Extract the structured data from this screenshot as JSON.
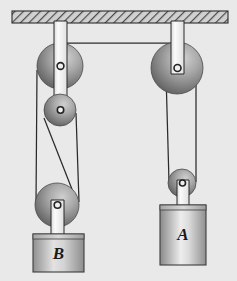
{
  "diagram": {
    "background_color": "#e9e9e9",
    "ceiling": {
      "label": "ceiling-support",
      "x": 12,
      "y": 11,
      "width": 216,
      "height": 12,
      "fill": "#c8c8c8",
      "stroke": "#2a2a2a",
      "hatch": "diagonal"
    },
    "rope_color": "#2b2b2b",
    "bracket_fill": "#f2f2f2",
    "bracket_stroke": "#2a2a2a",
    "pulleys": [
      {
        "name": "top-left-pulley",
        "cx": 60,
        "cy": 66,
        "r": 23,
        "label": ""
      },
      {
        "name": "middle-left-pulley",
        "cx": 60,
        "cy": 110,
        "r": 16,
        "label": ""
      },
      {
        "name": "bottom-left-pulley",
        "cx": 57,
        "cy": 205,
        "r": 22,
        "label": ""
      },
      {
        "name": "top-right-pulley",
        "cx": 177,
        "cy": 68,
        "r": 26,
        "label": ""
      },
      {
        "name": "lower-right-pulley",
        "cx": 182,
        "cy": 183,
        "r": 14,
        "label": ""
      }
    ],
    "blocks": [
      {
        "name": "block-b",
        "label": "B",
        "x": 33,
        "y": 234,
        "width": 51,
        "height": 38,
        "font_size": 17,
        "fill_light": "#e2e2e2",
        "fill_dark": "#8f8f8f"
      },
      {
        "name": "block-a",
        "label": "A",
        "x": 160,
        "y": 205,
        "width": 46,
        "height": 60,
        "font_size": 17,
        "fill_light": "#ededed",
        "fill_dark": "#8a8a8a"
      }
    ],
    "ropes": [
      {
        "name": "horizontal-connector-rope",
        "from": "top-left-pulley",
        "to": "top-right-pulley"
      },
      {
        "name": "left-outer-rope-strand",
        "from": "top-left-pulley",
        "to": "bottom-left-pulley"
      },
      {
        "name": "left-inner-rope-strand",
        "from": "middle-left-pulley",
        "to": "bottom-left-pulley"
      },
      {
        "name": "left-slanted-rope-strand",
        "from": "middle-left-pulley",
        "to": "bottom-left-pulley"
      },
      {
        "name": "right-rope-strand-left",
        "from": "top-right-pulley",
        "to": "lower-right-pulley"
      },
      {
        "name": "right-rope-strand-right",
        "from": "top-right-pulley",
        "to": "lower-right-pulley"
      }
    ]
  }
}
